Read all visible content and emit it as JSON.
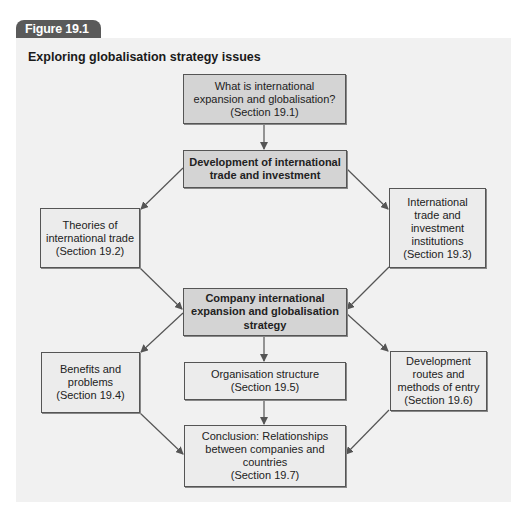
{
  "figure": {
    "tab_label": "Figure 19.1",
    "title": "Exploring globalisation strategy issues"
  },
  "nodes": {
    "what_is": {
      "text": "What is international\nexpansion and globalisation?\n(Section 19.1)"
    },
    "development": {
      "text": "Development of international\ntrade and investment"
    },
    "theories": {
      "text": "Theories of\ninternational trade\n(Section 19.2)"
    },
    "institutions": {
      "text": "International\ntrade and\ninvestment\ninstitutions\n(Section 19.3)"
    },
    "company": {
      "text": "Company international\nexpansion and globalisation\nstrategy"
    },
    "benefits": {
      "text": "Benefits and\nproblems\n(Section 19.4)"
    },
    "organisation": {
      "text": "Organisation structure\n(Section 19.5)"
    },
    "routes": {
      "text": "Development\nroutes and\nmethods of entry\n(Section 19.6)"
    },
    "conclusion": {
      "text": "Conclusion: Relationships\nbetween companies and\ncountries\n(Section 19.7)"
    }
  },
  "edges": [
    [
      "what_is",
      "development"
    ],
    [
      "development",
      "theories"
    ],
    [
      "development",
      "institutions"
    ],
    [
      "theories",
      "company"
    ],
    [
      "institutions",
      "company"
    ],
    [
      "company",
      "benefits"
    ],
    [
      "company",
      "organisation"
    ],
    [
      "company",
      "routes"
    ],
    [
      "benefits",
      "conclusion"
    ],
    [
      "organisation",
      "conclusion"
    ],
    [
      "routes",
      "conclusion"
    ]
  ],
  "colors": {
    "tab": "#5a5a5a",
    "panel": "#f1f1f1",
    "box_filled": "#d4d4d4",
    "box_plain": "#ececec",
    "line": "#555555"
  }
}
